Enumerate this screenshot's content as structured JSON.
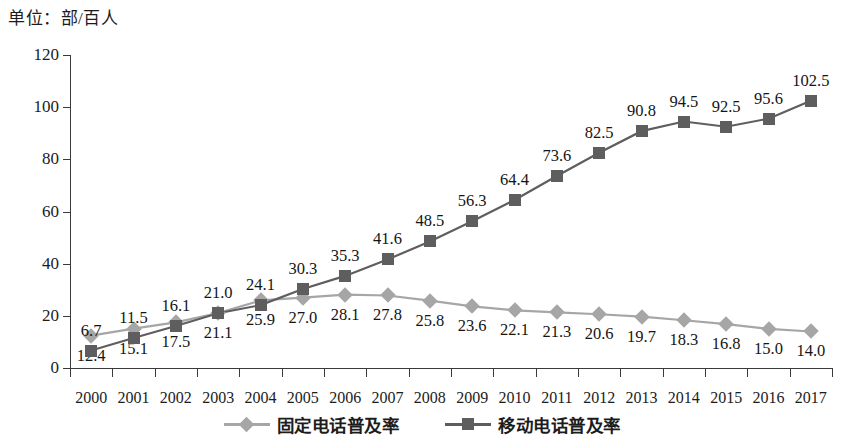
{
  "unit_label": "单位：部/百人",
  "colors": {
    "fixed": "#a6a6a6",
    "mobile": "#5e5e5e",
    "axis": "#3a3a3a",
    "text": "#151515",
    "background": "#ffffff"
  },
  "legend": {
    "position": "bottom",
    "items": [
      {
        "label": "固定电话普及率",
        "marker": "diamond-marker",
        "color": "#a6a6a6"
      },
      {
        "label": "移动电话普及率",
        "marker": "square-marker",
        "color": "#5e5e5e"
      }
    ]
  },
  "chart_data": {
    "type": "line",
    "title": "",
    "subtitle": "",
    "xlabel": "",
    "ylabel": "单位：部/百人",
    "ylim": [
      0,
      120
    ],
    "yticks": [
      0,
      20,
      40,
      60,
      80,
      100,
      120
    ],
    "grid": false,
    "legend_position": "bottom",
    "categories": [
      "2000",
      "2001",
      "2002",
      "2003",
      "2004",
      "2005",
      "2006",
      "2007",
      "2008",
      "2009",
      "2010",
      "2011",
      "2012",
      "2013",
      "2014",
      "2015",
      "2016",
      "2017"
    ],
    "series": [
      {
        "name": "固定电话普及率",
        "marker": "diamond",
        "color": "#a6a6a6",
        "label_position": "below",
        "values": [
          12.4,
          15.1,
          17.5,
          21.1,
          25.9,
          27.0,
          28.1,
          27.8,
          25.8,
          23.6,
          22.1,
          21.3,
          20.6,
          19.7,
          18.3,
          16.8,
          15.0,
          14.0
        ]
      },
      {
        "name": "移动电话普及率",
        "marker": "square",
        "color": "#5e5e5e",
        "label_position": "above",
        "values": [
          6.7,
          11.5,
          16.1,
          21.0,
          24.1,
          30.3,
          35.3,
          41.6,
          48.5,
          56.3,
          64.4,
          73.6,
          82.5,
          90.8,
          94.5,
          92.5,
          95.6,
          102.5
        ]
      }
    ],
    "data_labels": {
      "固定电话普及率": [
        "12.4",
        "15.1",
        "17.5",
        "21.1",
        "25.9",
        "27.0",
        "28.1",
        "27.8",
        "25.8",
        "23.6",
        "22.1",
        "21.3",
        "20.6",
        "19.7",
        "18.3",
        "16.8",
        "15.0",
        "14.0"
      ],
      "移动电话普及率": [
        "6.7",
        "11.5",
        "16.1",
        "21.0",
        "24.1",
        "30.3",
        "35.3",
        "41.6",
        "48.5",
        "56.3",
        "64.4",
        "73.6",
        "82.5",
        "90.8",
        "94.5",
        "92.5",
        "95.6",
        "102.5"
      ]
    }
  }
}
